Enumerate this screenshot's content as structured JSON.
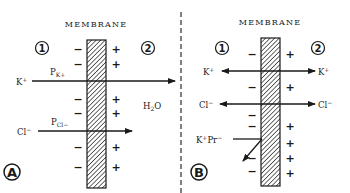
{
  "panels": [
    {
      "id": "A",
      "title": "MEMBRANE",
      "compartment_left": "1",
      "compartment_right": "2",
      "panel_label": "A",
      "left_signs": [
        "−",
        "−",
        "−",
        "−",
        "−",
        "−"
      ],
      "right_signs": [
        "+",
        "+",
        "+",
        "+",
        "+",
        "+"
      ],
      "k_label": "K",
      "k_charge": "+",
      "pk_label": "P",
      "pk_sub": "K+",
      "cl_label": "Cl",
      "cl_charge": "−",
      "pcl_label": "P",
      "pcl_sub": "Cl−",
      "water_label": "H",
      "water_sub": "2",
      "water_tail": "O"
    },
    {
      "id": "B",
      "title": "MEMBRANE",
      "compartment_left": "1",
      "compartment_right": "2",
      "panel_label": "B",
      "left_signs": [
        "−",
        "−",
        "−",
        "−",
        "−",
        "−"
      ],
      "right_signs": [
        "+",
        "+",
        "+",
        "+",
        "+",
        "+"
      ],
      "k_left": "K",
      "k_right": "K",
      "k_charge": "+",
      "cl_left": "Cl",
      "cl_right": "Cl",
      "cl_charge": "−",
      "kpr_label": "K",
      "kpr_charge1": "+",
      "kpr_mid": "Pr",
      "kpr_charge2": "−"
    }
  ],
  "colors": {
    "ink": "#1a1a1a",
    "background": "#ffffff"
  }
}
